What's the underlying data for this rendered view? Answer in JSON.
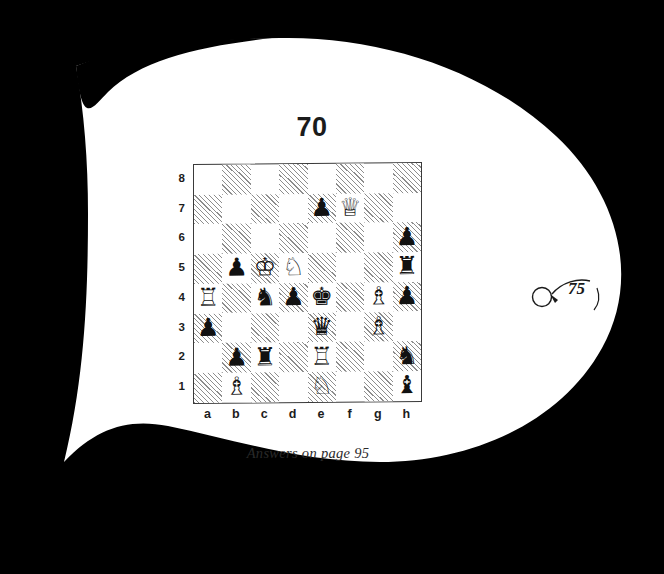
{
  "page": {
    "background_color": "#000000",
    "paper_color": "#ffffff",
    "folio_number": "75",
    "folio_marker_icon": "circle-and-swoosh-icon"
  },
  "puzzle": {
    "number": "70",
    "caption": "Answers on page 95"
  },
  "board": {
    "file_labels": [
      "a",
      "b",
      "c",
      "d",
      "e",
      "f",
      "g",
      "h"
    ],
    "rank_labels": [
      "8",
      "7",
      "6",
      "5",
      "4",
      "3",
      "2",
      "1"
    ],
    "light_square_color": "#ffffff",
    "dark_square_fill": "hatched-diagonal",
    "border_color": "#3a3a3a"
  },
  "chart_data": {
    "type": "table",
    "title": "70",
    "xlabel": "files",
    "ylabel": "ranks",
    "categories": [
      "a",
      "b",
      "c",
      "d",
      "e",
      "f",
      "g",
      "h"
    ],
    "rows": [
      "8",
      "7",
      "6",
      "5",
      "4",
      "3",
      "2",
      "1"
    ],
    "pieces": [
      {
        "square": "e7",
        "color": "black",
        "type": "pawn",
        "glyph": "♟"
      },
      {
        "square": "f7",
        "color": "white",
        "type": "queen",
        "glyph": "♕"
      },
      {
        "square": "h6",
        "color": "black",
        "type": "pawn",
        "glyph": "♟"
      },
      {
        "square": "b5",
        "color": "black",
        "type": "pawn",
        "glyph": "♟"
      },
      {
        "square": "c5",
        "color": "white",
        "type": "king",
        "glyph": "♔"
      },
      {
        "square": "d5",
        "color": "white",
        "type": "knight",
        "glyph": "♘"
      },
      {
        "square": "h5",
        "color": "black",
        "type": "rook",
        "glyph": "♜"
      },
      {
        "square": "a4",
        "color": "white",
        "type": "rook",
        "glyph": "♖"
      },
      {
        "square": "c4",
        "color": "black",
        "type": "knight",
        "glyph": "♞"
      },
      {
        "square": "d4",
        "color": "black",
        "type": "pawn",
        "glyph": "♟"
      },
      {
        "square": "e4",
        "color": "black",
        "type": "king",
        "glyph": "♚"
      },
      {
        "square": "g4",
        "color": "white",
        "type": "bishop",
        "glyph": "♗"
      },
      {
        "square": "h4",
        "color": "black",
        "type": "pawn",
        "glyph": "♟"
      },
      {
        "square": "a3",
        "color": "black",
        "type": "pawn",
        "glyph": "♟"
      },
      {
        "square": "e3",
        "color": "black",
        "type": "queen",
        "glyph": "♛"
      },
      {
        "square": "g3",
        "color": "white",
        "type": "bishop",
        "glyph": "♗"
      },
      {
        "square": "b2",
        "color": "black",
        "type": "pawn",
        "glyph": "♟"
      },
      {
        "square": "c2",
        "color": "black",
        "type": "rook",
        "glyph": "♜"
      },
      {
        "square": "e2",
        "color": "white",
        "type": "rook",
        "glyph": "♖"
      },
      {
        "square": "h2",
        "color": "black",
        "type": "knight",
        "glyph": "♞"
      },
      {
        "square": "b1",
        "color": "white",
        "type": "bishop",
        "glyph": "♗"
      },
      {
        "square": "e1",
        "color": "white",
        "type": "knight",
        "glyph": "♘"
      },
      {
        "square": "h1",
        "color": "black",
        "type": "bishop",
        "glyph": "♝"
      }
    ]
  }
}
